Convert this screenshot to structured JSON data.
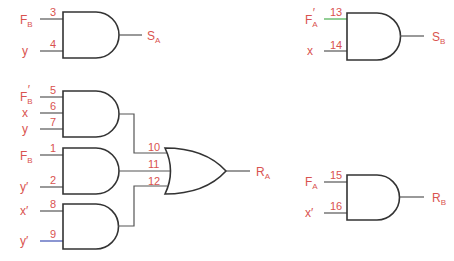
{
  "colors": {
    "label": "#d9534f",
    "wire": "#555555",
    "gate": "#333333",
    "wire_green": "#4caf50",
    "wire_blue": "#3f51b5"
  },
  "gates": [
    {
      "id": "and-sa",
      "type": "AND",
      "inputs": [
        {
          "pin": "3",
          "label": "F",
          "sub": "B",
          "prime": ""
        },
        {
          "pin": "4",
          "label": "y",
          "sub": "",
          "prime": ""
        }
      ],
      "output": {
        "label": "S",
        "sub": "A"
      }
    },
    {
      "id": "and-sb",
      "type": "AND",
      "inputs": [
        {
          "pin": "13",
          "label": "F",
          "sub": "A",
          "prime": "′"
        },
        {
          "pin": "14",
          "label": "x",
          "sub": "",
          "prime": ""
        }
      ],
      "output": {
        "label": "S",
        "sub": "B"
      }
    },
    {
      "id": "and-1",
      "type": "AND",
      "inputs": [
        {
          "pin": "5",
          "label": "F",
          "sub": "B",
          "prime": "′"
        },
        {
          "pin": "6",
          "label": "x",
          "sub": "",
          "prime": ""
        },
        {
          "pin": "7",
          "label": "y",
          "sub": "",
          "prime": ""
        }
      ]
    },
    {
      "id": "and-2",
      "type": "AND",
      "inputs": [
        {
          "pin": "1",
          "label": "F",
          "sub": "B",
          "prime": ""
        },
        {
          "pin": "2",
          "label": "y",
          "sub": "",
          "prime": "′"
        }
      ]
    },
    {
      "id": "and-3",
      "type": "AND",
      "inputs": [
        {
          "pin": "8",
          "label": "x",
          "sub": "",
          "prime": "′"
        },
        {
          "pin": "9",
          "label": "y",
          "sub": "",
          "prime": "′"
        }
      ]
    },
    {
      "id": "or-ra",
      "type": "OR",
      "inputs": [
        {
          "pin": "10"
        },
        {
          "pin": "11"
        },
        {
          "pin": "12"
        }
      ],
      "output": {
        "label": "R",
        "sub": "A"
      }
    },
    {
      "id": "and-rb",
      "type": "AND",
      "inputs": [
        {
          "pin": "15",
          "label": "F",
          "sub": "A",
          "prime": ""
        },
        {
          "pin": "16",
          "label": "x",
          "sub": "",
          "prime": "′"
        }
      ],
      "output": {
        "label": "R",
        "sub": "B"
      }
    }
  ]
}
